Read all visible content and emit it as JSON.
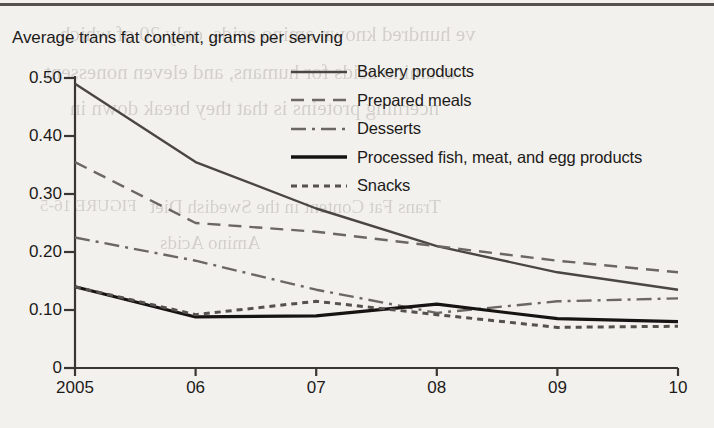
{
  "figure": {
    "title": "Average trans fat content, grams per serving",
    "top_rule": "page-rule"
  },
  "bleed_text": [
    {
      "text": "ve hundred known amino acids, only 20 of which",
      "x": 60,
      "y": 22,
      "size": 21
    },
    {
      "text": "al amino acids for humans, and eleven nonessent",
      "x": 45,
      "y": 60,
      "size": 21
    },
    {
      "text": "ncerning proteins is that they break down in",
      "x": 70,
      "y": 96,
      "size": 21
    },
    {
      "text": "FIGURE 16-5",
      "x": 40,
      "y": 196,
      "size": 17
    },
    {
      "text": "Trans Fat Content in the Swedish Diet",
      "x": 150,
      "y": 196,
      "size": 19
    },
    {
      "text": "Amino Acids",
      "x": 160,
      "y": 232,
      "size": 19
    }
  ],
  "chart_data": {
    "type": "line",
    "title": "Average trans fat content, grams per serving",
    "xlabel": "",
    "ylabel": "",
    "x": [
      "2005",
      "06",
      "07",
      "08",
      "09",
      "10"
    ],
    "xlim": [
      0,
      5
    ],
    "ylim": [
      0,
      0.5
    ],
    "yticks": [
      0,
      0.1,
      0.2,
      0.3,
      0.4,
      0.5
    ],
    "ytick_labels": [
      "0",
      "0.10",
      "0.20",
      "0.30",
      "0.40",
      "0.50"
    ],
    "grid": false,
    "legend_position": "upper-right-inside",
    "series": [
      {
        "name": "Bakery products",
        "style": "solid",
        "width": 2.4,
        "color": "#4a4642",
        "values": [
          0.49,
          0.355,
          0.275,
          0.21,
          0.165,
          0.135
        ]
      },
      {
        "name": "Prepared meals",
        "style": "dashed",
        "width": 2.4,
        "color": "#6b6763",
        "values": [
          0.355,
          0.25,
          0.235,
          0.21,
          0.185,
          0.165
        ]
      },
      {
        "name": "Desserts",
        "style": "dashdot",
        "width": 2.4,
        "color": "#6b6763",
        "values": [
          0.225,
          0.185,
          0.135,
          0.095,
          0.115,
          0.12
        ]
      },
      {
        "name": "Processed fish, meat, and egg products",
        "style": "solid",
        "width": 3.2,
        "color": "#161412",
        "values": [
          0.14,
          0.088,
          0.09,
          0.11,
          0.085,
          0.08
        ]
      },
      {
        "name": "Snacks",
        "style": "dotted",
        "width": 3.0,
        "color": "#55514d",
        "values": [
          0.14,
          0.092,
          0.115,
          0.092,
          0.07,
          0.072
        ]
      }
    ]
  },
  "legend": {
    "items": [
      {
        "label": "Bakery products",
        "style": "solid",
        "color": "#4a4642",
        "width": 2.6
      },
      {
        "label": "Prepared meals",
        "style": "dashed",
        "color": "#6b6763",
        "width": 2.6
      },
      {
        "label": "Desserts",
        "style": "dashdot",
        "color": "#6b6763",
        "width": 2.6
      },
      {
        "label": "Processed fish, meat, and egg products",
        "style": "solid",
        "color": "#161412",
        "width": 3.4
      },
      {
        "label": "Snacks",
        "style": "dotted",
        "color": "#55514d",
        "width": 3.0
      }
    ]
  },
  "axis": {
    "color": "#3a3632",
    "left_px": 75,
    "right_px": 678,
    "top_px": 78,
    "bottom_px": 368
  }
}
